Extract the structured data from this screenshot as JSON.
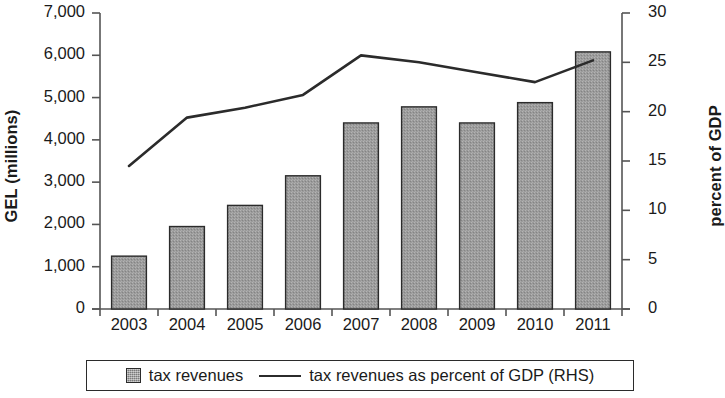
{
  "chart_data": {
    "type": "bar",
    "title": "",
    "subtitle": "",
    "xlabel": "",
    "ylabel": "GEL (millions)",
    "y2label": "percent of GDP",
    "categories": [
      "2003",
      "2004",
      "2005",
      "2006",
      "2007",
      "2008",
      "2009",
      "2010",
      "2011"
    ],
    "ylim": [
      0,
      7000
    ],
    "y2lim": [
      0,
      30
    ],
    "yticks": [
      0,
      1000,
      2000,
      3000,
      4000,
      5000,
      6000,
      7000
    ],
    "ytick_labels": [
      "0",
      "1,000",
      "2,000",
      "3,000",
      "4,000",
      "5,000",
      "6,000",
      "7,000"
    ],
    "y2ticks": [
      0,
      5,
      10,
      15,
      20,
      25,
      30
    ],
    "y2tick_labels": [
      "0",
      "5",
      "10",
      "15",
      "20",
      "25",
      "30"
    ],
    "grid": false,
    "legend_position": "bottom",
    "series": [
      {
        "name": "tax revenues",
        "kind": "bar",
        "axis": "left",
        "color": "#9b9b9b",
        "edge_color": "#2b2b2b",
        "values": [
          1250,
          1950,
          2450,
          3150,
          4400,
          4780,
          4400,
          4880,
          6080
        ]
      },
      {
        "name": "tax revenues as percent of GDP (RHS)",
        "kind": "line",
        "axis": "right",
        "color": "#2b2b2b",
        "values": [
          14.5,
          19.4,
          20.4,
          21.7,
          25.7,
          25.0,
          24.0,
          23.0,
          25.2
        ]
      }
    ]
  },
  "legend": {
    "entries": [
      {
        "label": "tax revenues",
        "marker": "square-swatch"
      },
      {
        "label": "tax revenues as percent of GDP (RHS)",
        "marker": "line-swatch"
      }
    ]
  },
  "colors": {
    "bar_fill": "#9b9b9b",
    "bar_edge": "#2b2b2b",
    "line": "#2b2b2b",
    "axis": "#555555",
    "text": "#1a1a1a",
    "background": "#ffffff"
  }
}
